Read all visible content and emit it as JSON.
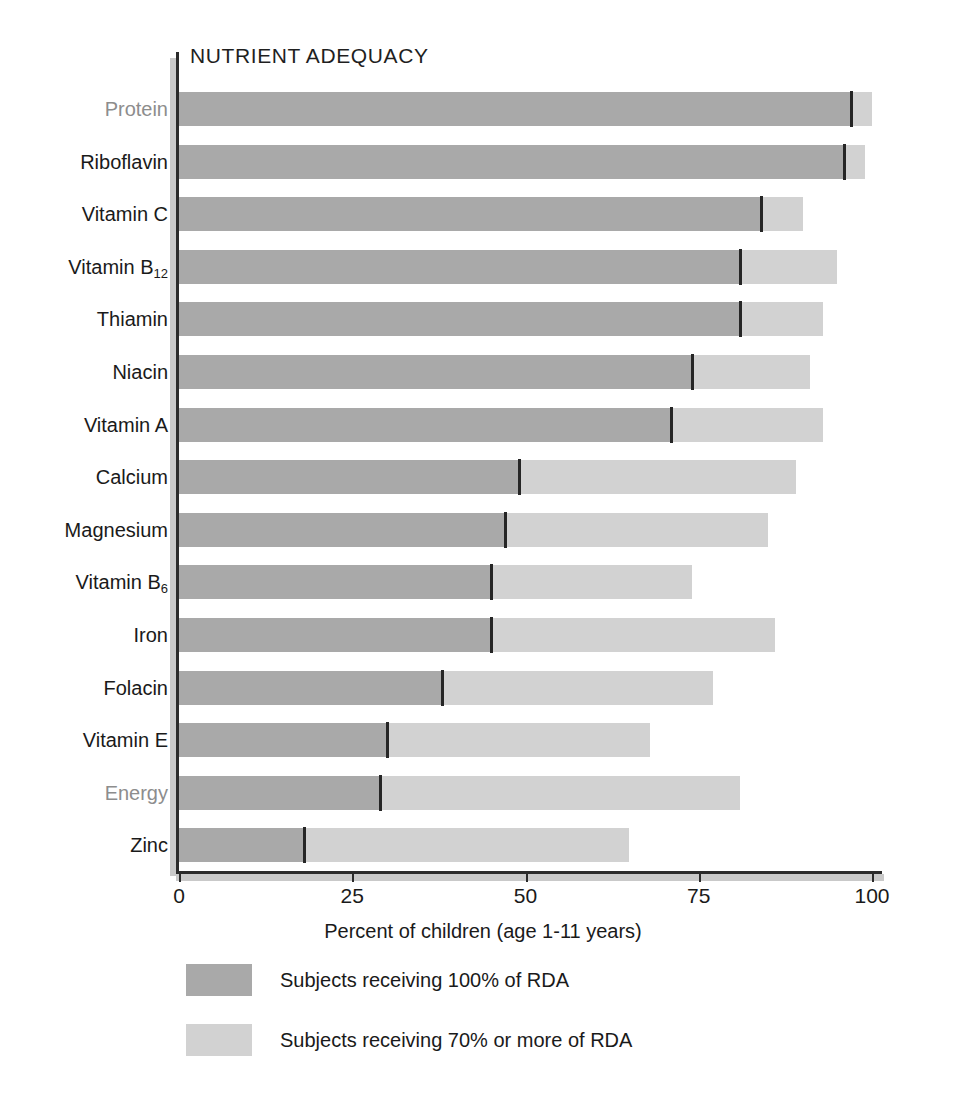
{
  "chart_data": {
    "type": "bar",
    "orientation": "horizontal",
    "stacked": true,
    "title": "NUTRIENT ADEQUACY",
    "xlabel": "Percent of children (age 1-11 years)",
    "ylabel": "",
    "xlim": [
      0,
      100
    ],
    "xticks": [
      0,
      25,
      50,
      75,
      100
    ],
    "xtick_labels": [
      "0",
      "25",
      "50",
      "75",
      "100"
    ],
    "grid": false,
    "legend_position": "below",
    "categories": [
      "Protein",
      "Riboflavin",
      "Vitamin C",
      "Vitamin B12",
      "Thiamin",
      "Niacin",
      "Vitamin A",
      "Calcium",
      "Magnesium",
      "Vitamin B6",
      "Iron",
      "Folacin",
      "Vitamin E",
      "Energy",
      "Zinc"
    ],
    "series": [
      {
        "name": "Subjects receiving 100% of RDA",
        "color": "#a9a9a9",
        "values": [
          97,
          96,
          84,
          81,
          81,
          74,
          71,
          49,
          47,
          45,
          45,
          38,
          30,
          29,
          18
        ]
      },
      {
        "name": "Subjects receiving 70% or more of RDA",
        "color": "#d2d2d2",
        "values": [
          100,
          99,
          90,
          95,
          93,
          91,
          93,
          89,
          85,
          74,
          86,
          77,
          68,
          81,
          65
        ]
      }
    ]
  },
  "rows": [
    {
      "label": "Protein",
      "label_html": "Protein",
      "muted": true,
      "dark": 97,
      "light": 100
    },
    {
      "label": "Riboflavin",
      "label_html": "Riboflavin",
      "muted": false,
      "dark": 96,
      "light": 99
    },
    {
      "label": "Vitamin C",
      "label_html": "Vitamin C",
      "muted": false,
      "dark": 84,
      "light": 90
    },
    {
      "label": "Vitamin B12",
      "label_html": "Vitamin B<sub>12</sub>",
      "muted": false,
      "dark": 81,
      "light": 95
    },
    {
      "label": "Thiamin",
      "label_html": "Thiamin",
      "muted": false,
      "dark": 81,
      "light": 93
    },
    {
      "label": "Niacin",
      "label_html": "Niacin",
      "muted": false,
      "dark": 74,
      "light": 91
    },
    {
      "label": "Vitamin A",
      "label_html": "Vitamin A",
      "muted": false,
      "dark": 71,
      "light": 93
    },
    {
      "label": "Calcium",
      "label_html": "Calcium",
      "muted": false,
      "dark": 49,
      "light": 89
    },
    {
      "label": "Magnesium",
      "label_html": "Magnesium",
      "muted": false,
      "dark": 47,
      "light": 85
    },
    {
      "label": "Vitamin B6",
      "label_html": "Vitamin B<sub>6</sub>",
      "muted": false,
      "dark": 45,
      "light": 74
    },
    {
      "label": "Iron",
      "label_html": "Iron",
      "muted": false,
      "dark": 45,
      "light": 86
    },
    {
      "label": "Folacin",
      "label_html": "Folacin",
      "muted": false,
      "dark": 38,
      "light": 77
    },
    {
      "label": "Vitamin E",
      "label_html": "Vitamin E",
      "muted": false,
      "dark": 30,
      "light": 68
    },
    {
      "label": "Energy",
      "label_html": "Energy",
      "muted": true,
      "dark": 29,
      "light": 81
    },
    {
      "label": "Zinc",
      "label_html": "Zinc",
      "muted": false,
      "dark": 18,
      "light": 65
    }
  ],
  "axis": {
    "x_label": "Percent of children (age 1-11 years)",
    "ticks": [
      "0",
      "25",
      "50",
      "75",
      "100"
    ]
  },
  "legend": {
    "items": [
      {
        "label": "Subjects receiving 100% of RDA",
        "color": "#a9a9a9"
      },
      {
        "label": "Subjects receiving 70% or more of RDA",
        "color": "#d2d2d2"
      }
    ]
  },
  "colors": {
    "dark_gray": "#a9a9a9",
    "light_gray": "#d2d2d2",
    "axis": "#2b2b2b",
    "muted_label": "#8d8d8d",
    "text": "#1a1a1a"
  }
}
